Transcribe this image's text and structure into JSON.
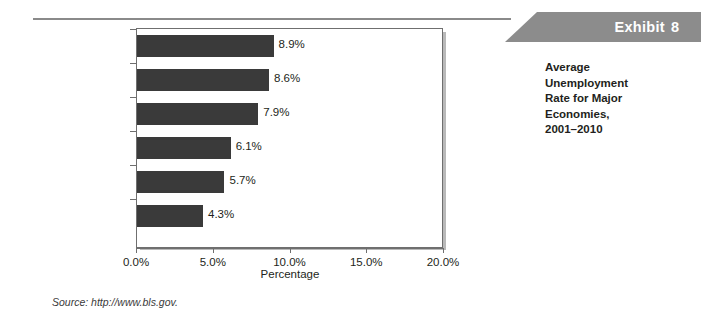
{
  "exhibit": {
    "label": "Exhibit",
    "number": "8",
    "caption": "Average\nUnemployment\nRate for Major\nEconomies,\n2001–2010"
  },
  "source": {
    "text": "Source: http://www.bls.gov."
  },
  "colors": {
    "bar": "#3a3a3a",
    "banner": "#8c8c8c",
    "frame": "#6f6f6f",
    "shadow": "#b9b9b9",
    "rule": "#8a8a8a"
  },
  "chart_data": {
    "type": "bar",
    "orientation": "horizontal",
    "title": "",
    "xlabel": "Percentage",
    "ylabel": "",
    "categories": [
      "Germany",
      "France",
      "Italy",
      "United States",
      "United Kingdom",
      "Japan"
    ],
    "values": [
      8.9,
      8.6,
      7.9,
      6.1,
      5.7,
      4.3
    ],
    "data_labels": [
      "8.9%",
      "8.6%",
      "7.9%",
      "6.1%",
      "5.7%",
      "4.3%"
    ],
    "xlim": [
      0,
      20
    ],
    "xticks": [
      0,
      5,
      10,
      15,
      20
    ],
    "xtick_labels": [
      "0.0%",
      "5.0%",
      "10.0%",
      "15.0%",
      "20.0%"
    ],
    "grid": false,
    "legend": false
  }
}
